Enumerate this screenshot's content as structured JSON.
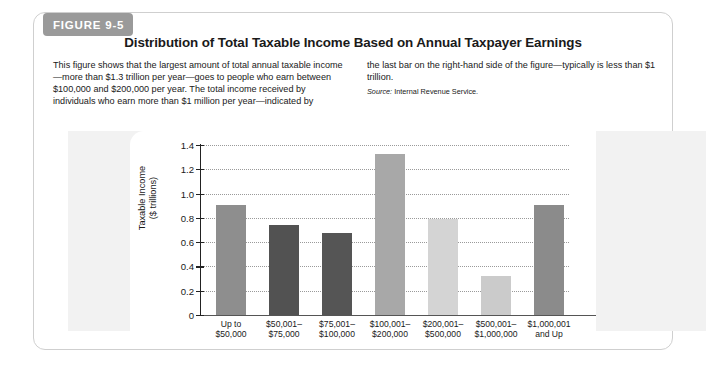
{
  "figure": {
    "tag": "FIGURE 9-5",
    "title": "Distribution of Total Taxable Income Based on Annual Taxpayer Earnings",
    "caption_left": "This figure shows that the largest amount of total annual taxable income—more than $1.3 trillion per year—goes to people who earn between $100,000 and $200,000 per year. The total income received by individuals who earn more than $1 million per year—indicated by",
    "caption_right": "the last bar on the right-hand side of the figure—typically is less than $1 trillion.",
    "source_label": "Source:",
    "source_text": " Internal Revenue Service."
  },
  "colors": {
    "tag_background": "#9a9a9a",
    "card_border": "#cfcfcf",
    "strip_background": "#f2f2f2",
    "gridline": "#9a9a9a",
    "axis": "#222222"
  },
  "chart_data": {
    "type": "bar",
    "title": "Distribution of Total Taxable Income Based on Annual Taxpayer Earnings",
    "xlabel": "",
    "ylabel": "Taxable Income ($ trillions)",
    "ylabel_line1": "Taxable Income",
    "ylabel_line2": "($ trillions)",
    "ylim": [
      0,
      1.4
    ],
    "ytick_labels": [
      "1.4",
      "1.2",
      "1.0",
      "0.8",
      "0.6",
      "0.4",
      "0.2",
      "0"
    ],
    "ytick_values": [
      1.4,
      1.2,
      1.0,
      0.8,
      0.6,
      0.4,
      0.2,
      0
    ],
    "grid": true,
    "legend": "none",
    "categories": [
      "Up to\n$50,000",
      "$50,001–\n$75,000",
      "$75,001–\n$100,000",
      "$100,001–\n$200,000",
      "$200,001–\n$500,000",
      "$500,001–\n$1,000,000",
      "$1,000,001\nand Up"
    ],
    "category_lines": [
      [
        "Up to",
        "$50,000"
      ],
      [
        "$50,001–",
        "$75,000"
      ],
      [
        "$75,001–",
        "$100,000"
      ],
      [
        "$100,001–",
        "$200,000"
      ],
      [
        "$200,001–",
        "$500,000"
      ],
      [
        "$500,001–",
        "$1,000,000"
      ],
      [
        "$1,000,001",
        "and Up"
      ]
    ],
    "values": [
      0.91,
      0.745,
      0.675,
      1.33,
      0.79,
      0.325,
      0.905
    ],
    "bar_colors": [
      "#8e8e8e",
      "#525252",
      "#555555",
      "#a8a8a8",
      "#d4d4d4",
      "#cbcbcb",
      "#8b8b8b"
    ]
  }
}
